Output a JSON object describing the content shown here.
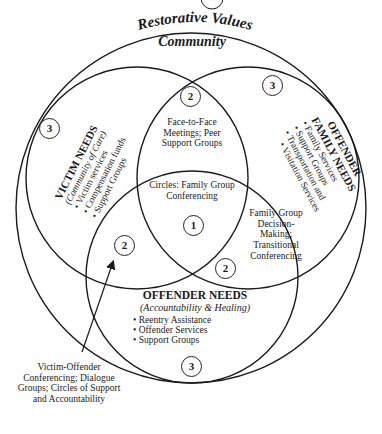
{
  "title": "Restorative Values",
  "outer_label": "Community",
  "top_marker": "",
  "circles": {
    "victim": {
      "heading": "VICTIM NEEDS",
      "subheading": "(Community of Care)",
      "items": [
        "Victim services",
        "Compensation funds",
        "Support Groups"
      ],
      "level": "3"
    },
    "offender_family": {
      "heading_line1": "OFFENDER",
      "heading_line2": "FAMILY NEEDS",
      "items": [
        "Family Services",
        "Support Groups",
        "Transportation and",
        "Visitation Services"
      ],
      "level": "3"
    },
    "offender": {
      "heading": "OFFENDER NEEDS",
      "subheading": "(Accountability & Healing)",
      "items": [
        "Reentry Assistance",
        "Offender Services",
        "Support Groups"
      ],
      "level": "3"
    }
  },
  "overlaps": {
    "victim_family": {
      "text": "Face-to-Face Meetings; Peer Support Groups",
      "level": "2"
    },
    "family_offender": {
      "text": "Family Group Decision-Making; Transitional Conferencing",
      "level": "2"
    },
    "victim_offender": {
      "text": "Victim-Offender Conferencing; Dialogue Groups; Circles of Support and Accountability",
      "level": "2"
    },
    "center": {
      "text": "Circles: Family Group Conferencing",
      "level": "1"
    }
  },
  "colors": {
    "line": "#1a1a1a",
    "background": "#ffffff"
  }
}
